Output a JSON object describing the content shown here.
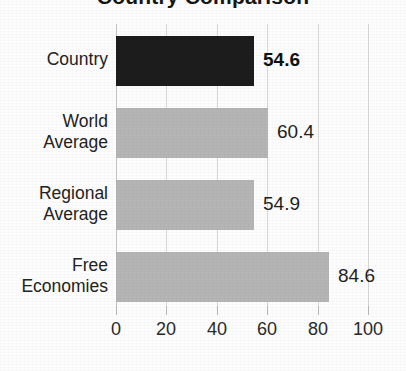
{
  "chart_data": {
    "type": "bar",
    "orientation": "horizontal",
    "title": "Country Comparison",
    "title_clipped": true,
    "categories": [
      "Country",
      "World Average",
      "Regional Average",
      "Free Economies"
    ],
    "values": [
      54.6,
      60.4,
      54.9,
      84.6
    ],
    "value_labels": [
      "54.6",
      "60.4",
      "54.9",
      "84.6"
    ],
    "highlight_index": 0,
    "xlabel": "",
    "ylabel": "",
    "xlim": [
      0,
      100
    ],
    "xticks": [
      0,
      20,
      40,
      60,
      80,
      100
    ],
    "xtick_labels": [
      "0",
      "20",
      "40",
      "60",
      "80",
      "100"
    ],
    "grid": true,
    "legend": false,
    "colors": {
      "highlight_bar": "#1d1d1d",
      "bar": "#b5b5b5",
      "gridline": "#d8d8d8",
      "text": "#222222",
      "background": "#fdfdfd"
    }
  },
  "axis": {
    "ticks": [
      {
        "label": "0",
        "value": 0
      },
      {
        "label": "20",
        "value": 20
      },
      {
        "label": "40",
        "value": 40
      },
      {
        "label": "60",
        "value": 60
      },
      {
        "label": "80",
        "value": 80
      },
      {
        "label": "100",
        "value": 100
      }
    ]
  },
  "bars": [
    {
      "label_line1": "Country",
      "label_line2": "",
      "value_label": "54.6",
      "value": 54.6,
      "style": "dark"
    },
    {
      "label_line1": "World",
      "label_line2": "Average",
      "value_label": "60.4",
      "value": 60.4,
      "style": "light"
    },
    {
      "label_line1": "Regional",
      "label_line2": "Average",
      "value_label": "54.9",
      "value": 54.9,
      "style": "light"
    },
    {
      "label_line1": "Free",
      "label_line2": "Economies",
      "value_label": "84.6",
      "value": 84.6,
      "style": "light"
    }
  ]
}
